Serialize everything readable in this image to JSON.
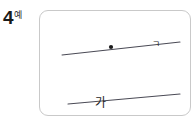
{
  "problem": {
    "number": "4",
    "tag": "예"
  },
  "figure": {
    "panel_border_color": "#c9c9c9",
    "panel_background": "#ffffff",
    "stroke_color": "#4a4a55",
    "point_fill_color": "#1a1a1a",
    "upper_line": {
      "label": "ㄱ",
      "x1": 22,
      "y1": 44,
      "x2": 140,
      "y2": 31
    },
    "lower_line": {
      "label": "가",
      "x1": 28,
      "y1": 93,
      "x2": 140,
      "y2": 83
    },
    "point": {
      "label": "ㄱ",
      "cx": 71,
      "cy": 36,
      "r": 2.1
    }
  }
}
